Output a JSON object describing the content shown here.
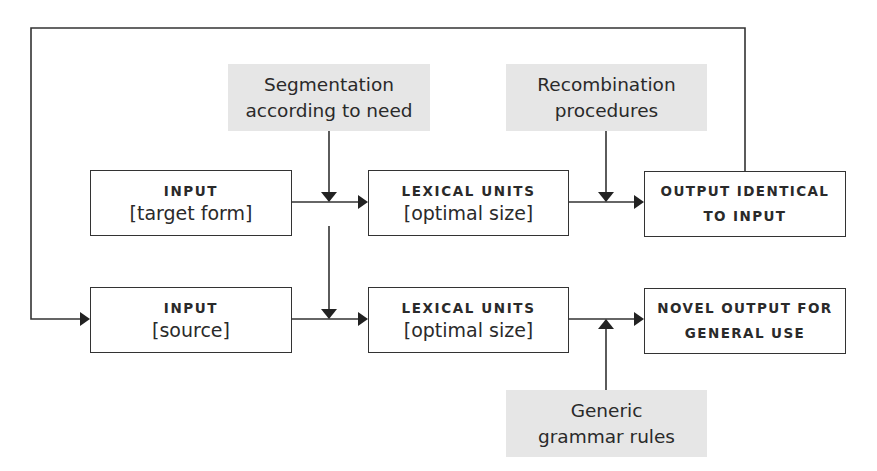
{
  "diagram": {
    "process_labels": {
      "segmentation": [
        "Segmentation",
        "according to need"
      ],
      "recombination": [
        "Recombination",
        "procedures"
      ],
      "grammar": [
        "Generic",
        "grammar rules"
      ]
    },
    "row1": {
      "input": {
        "title": "INPUT",
        "sub": "[target form]"
      },
      "lexical": {
        "title": "LEXICAL UNITS",
        "sub": "[optimal size]"
      },
      "output": {
        "line1": "OUTPUT IDENTICAL",
        "line2": "TO INPUT"
      }
    },
    "row2": {
      "input": {
        "title": "INPUT",
        "sub": "[source]"
      },
      "lexical": {
        "title": "LEXICAL UNITS",
        "sub": "[optimal size]"
      },
      "output": {
        "line1": "NOVEL OUTPUT FOR",
        "line2": "GENERAL USE"
      }
    },
    "colors": {
      "line": "#333333",
      "label_bg": "#e6e6e6",
      "box_border": "#333333"
    }
  }
}
